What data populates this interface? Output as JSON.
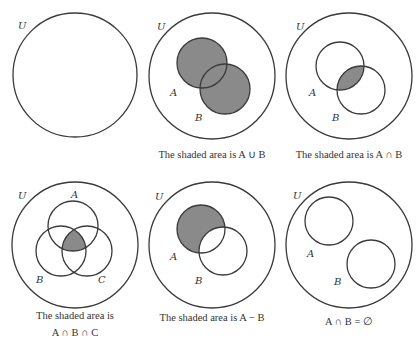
{
  "shade_color": "#8a8a8a",
  "panels": [
    {
      "id": "universe-only",
      "universe_label": "U",
      "sets": [],
      "caption_lines": []
    },
    {
      "id": "union",
      "universe_label": "U",
      "sets": [
        "A",
        "B"
      ],
      "shaded": "A ∪ B",
      "caption_lines": [
        "The shaded area is A ∪ B"
      ]
    },
    {
      "id": "intersection",
      "universe_label": "U",
      "sets": [
        "A",
        "B"
      ],
      "shaded": "A ∩ B",
      "caption_lines": [
        "The shaded area is A ∩ B"
      ]
    },
    {
      "id": "triple-intersection",
      "universe_label": "U",
      "sets": [
        "A",
        "B",
        "C"
      ],
      "shaded": "A ∩ B ∩ C",
      "caption_lines": [
        "The shaded area is",
        "A ∩ B ∩ C"
      ]
    },
    {
      "id": "difference",
      "universe_label": "U",
      "sets": [
        "A",
        "B"
      ],
      "shaded": "A − B",
      "caption_lines": [
        "The shaded area is A − B"
      ]
    },
    {
      "id": "disjoint",
      "universe_label": "U",
      "sets": [
        "A",
        "B"
      ],
      "shaded": "",
      "caption_lines": [
        "A ∩ B = ∅"
      ]
    }
  ]
}
